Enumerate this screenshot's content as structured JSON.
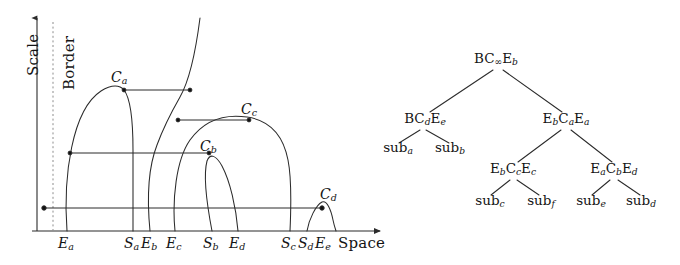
{
  "figure": {
    "left_panel": {
      "name": "scale-space-diagram",
      "y_axis_label": "Scale",
      "x_axis_label": "Space",
      "border_label": "Border",
      "tick_labels": [
        {
          "id": "Ea",
          "base": "E",
          "sub": "a",
          "x": 67
        },
        {
          "id": "Sa",
          "base": "S",
          "sub": "a",
          "x": 133
        },
        {
          "id": "Eb",
          "base": "E",
          "sub": "b",
          "x": 150
        },
        {
          "id": "Ec",
          "base": "E",
          "sub": "c",
          "x": 175
        },
        {
          "id": "Sb",
          "base": "S",
          "sub": "b",
          "x": 212
        },
        {
          "id": "Ed",
          "base": "E",
          "sub": "d",
          "x": 238
        },
        {
          "id": "Sc",
          "base": "S",
          "sub": "c",
          "x": 290
        },
        {
          "id": "Sd",
          "base": "S",
          "sub": "d",
          "x": 307
        },
        {
          "id": "Ee",
          "base": "E",
          "sub": "e",
          "x": 324
        }
      ],
      "critical_points": [
        {
          "id": "Ca",
          "base": "C",
          "sub": "a",
          "x": 121,
          "y": 86
        },
        {
          "id": "Cb",
          "base": "C",
          "sub": "b",
          "x": 210,
          "y": 155
        },
        {
          "id": "Cc",
          "base": "C",
          "sub": "c",
          "x": 251,
          "y": 118
        },
        {
          "id": "Cd",
          "base": "C",
          "sub": "d",
          "x": 330,
          "y": 203
        }
      ]
    },
    "right_panel": {
      "name": "binary-interval-tree",
      "levels": [
        {
          "level": 0,
          "nodes": [
            {
              "id": "root",
              "x": 496,
              "y": 61,
              "parts": [
                {
                  "base": "BC",
                  "sub": "∞"
                },
                {
                  "base": "E",
                  "sub": "b"
                }
              ]
            }
          ]
        },
        {
          "level": 1,
          "nodes": [
            {
              "id": "n-left",
              "x": 425,
              "y": 121,
              "parts": [
                {
                  "base": "BC",
                  "sub": "d"
                },
                {
                  "base": "E",
                  "sub": "e"
                }
              ]
            },
            {
              "id": "n-right",
              "x": 566,
              "y": 121,
              "parts": [
                {
                  "base": "E",
                  "sub": "b"
                },
                {
                  "base": "C",
                  "sub": "a"
                },
                {
                  "base": "E",
                  "sub": "a"
                }
              ]
            }
          ]
        },
        {
          "level": 2,
          "nodes": [
            {
              "id": "n-right-left",
              "x": 513,
              "y": 171,
              "parts": [
                {
                  "base": "E",
                  "sub": "b"
                },
                {
                  "base": "C",
                  "sub": "c"
                },
                {
                  "base": "E",
                  "sub": "c"
                }
              ]
            },
            {
              "id": "n-right-right",
              "x": 614,
              "y": 171,
              "parts": [
                {
                  "base": "E",
                  "sub": "a"
                },
                {
                  "base": "C",
                  "sub": "b"
                },
                {
                  "base": "E",
                  "sub": "d"
                }
              ]
            }
          ]
        }
      ],
      "leaves": [
        {
          "id": "sub-a",
          "base": "sub",
          "sub": "a",
          "x": 398,
          "y": 150
        },
        {
          "id": "sub-b",
          "base": "sub",
          "sub": "b",
          "x": 450,
          "y": 150
        },
        {
          "id": "sub-c",
          "base": "sub",
          "sub": "c",
          "x": 490,
          "y": 203
        },
        {
          "id": "sub-f",
          "base": "sub",
          "sub": "f",
          "x": 541,
          "y": 203
        },
        {
          "id": "sub-e",
          "base": "sub",
          "sub": "e",
          "x": 591,
          "y": 203
        },
        {
          "id": "sub-d",
          "base": "sub",
          "sub": "d",
          "x": 641,
          "y": 203
        }
      ]
    },
    "style": {
      "line_color": "#2b2b2b",
      "dash_color": "#8d8d8d",
      "text_color": "#141414",
      "background": "#ffffff"
    }
  }
}
